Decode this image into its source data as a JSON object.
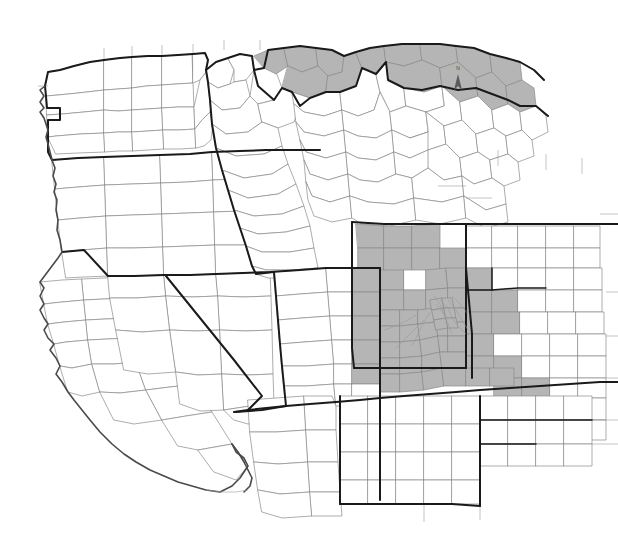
{
  "map": {
    "title": "Western United States County Map",
    "description": "Black and white county-level map of the western United States with selected counties shaded gray",
    "projection_note": "North-up orientation",
    "background_color": "#ffffff",
    "colors": {
      "shaded_county_fill": "#b5b5b5",
      "unshaded_county_fill": "#ffffff",
      "county_border": "#8a8a8a",
      "state_border": "#1a1a1a",
      "coastline": "#4a4a4a"
    },
    "north_arrow": {
      "label": "N",
      "x": 458,
      "y": 72
    },
    "legend": {
      "shaded_label": "",
      "unshaded_label": ""
    },
    "states": [
      {
        "code": "WA",
        "name": "Washington",
        "bold_outline": true
      },
      {
        "code": "OR",
        "name": "Oregon",
        "bold_outline": true
      },
      {
        "code": "CA",
        "name": "California",
        "bold_outline": true
      },
      {
        "code": "NV",
        "name": "Nevada",
        "bold_outline": true
      },
      {
        "code": "ID",
        "name": "Idaho",
        "bold_outline": true
      },
      {
        "code": "MT",
        "name": "Montana",
        "bold_outline": true
      },
      {
        "code": "WY",
        "name": "Wyoming",
        "bold_outline": true
      },
      {
        "code": "UT",
        "name": "Utah",
        "bold_outline": true
      },
      {
        "code": "CO",
        "name": "Colorado",
        "bold_outline": true
      },
      {
        "code": "AZ",
        "name": "Arizona",
        "bold_outline": true
      },
      {
        "code": "NM",
        "name": "New Mexico",
        "bold_outline": true
      },
      {
        "code": "ND",
        "name": "North Dakota",
        "bold_outline": false
      },
      {
        "code": "SD",
        "name": "South Dakota",
        "bold_outline": false
      },
      {
        "code": "NE",
        "name": "Nebraska",
        "bold_outline": false
      },
      {
        "code": "KS",
        "name": "Kansas",
        "bold_outline": false
      },
      {
        "code": "OK",
        "name": "Oklahoma",
        "bold_outline": false
      },
      {
        "code": "TX",
        "name": "Texas",
        "bold_outline": false
      }
    ],
    "shaded_regions": [
      {
        "region": "northern-montana",
        "state": "MT",
        "count": 8
      },
      {
        "region": "northeast-montana",
        "state": "MT",
        "count": 6
      },
      {
        "region": "northwest-wyoming",
        "state": "WY",
        "count": 7
      },
      {
        "region": "western-nebraska",
        "state": "NE",
        "count": 5
      },
      {
        "region": "northern-colorado",
        "state": "CO",
        "count": 12
      },
      {
        "region": "denver-metro",
        "state": "CO",
        "count": 14
      },
      {
        "region": "eastern-utah",
        "state": "UT",
        "count": 4
      },
      {
        "region": "southeast-colorado",
        "state": "CO",
        "count": 7
      },
      {
        "region": "western-kansas",
        "state": "KS",
        "count": 6
      },
      {
        "region": "south-dakota-west",
        "state": "SD",
        "count": 4
      }
    ]
  }
}
